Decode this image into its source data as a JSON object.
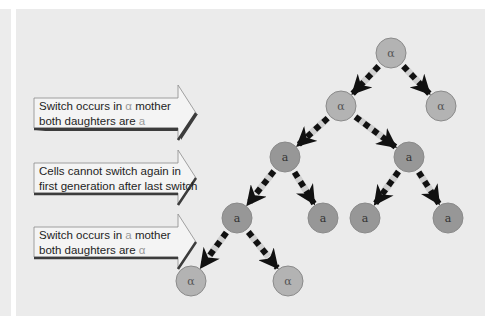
{
  "figure": {
    "title": "",
    "colors": {
      "background": "#ebebeb",
      "alpha_node_fill": "#b3b3b3",
      "a_node_fill": "#979797",
      "node_stroke": "#8a8a8a",
      "arrow": "#111111",
      "dash_light": "#cfcfcf",
      "callout_fill": "#f4f4f4",
      "callout_shadow": "#3c3c3c",
      "highlight_letter": "#9a9a9a"
    }
  },
  "callouts": [
    {
      "line1_pre": "Switch occurs in ",
      "line1_symbol": "α",
      "line1_post": " mother",
      "line2_pre": "both daughters are ",
      "line2_symbol": "a"
    },
    {
      "line1": "Cells cannot switch again in",
      "line2": "first generation after last switch"
    },
    {
      "line1_pre": "Switch occurs in ",
      "line1_symbol": "a",
      "line1_post": " mother",
      "line2_pre": "both daughters are ",
      "line2_symbol": "α"
    }
  ],
  "tree": {
    "nodes": [
      {
        "id": "root",
        "label": "α",
        "type": "alpha",
        "x": 391,
        "y": 53
      },
      {
        "id": "g1-left",
        "label": "α",
        "type": "alpha",
        "x": 341,
        "y": 106
      },
      {
        "id": "g1-right",
        "label": "α",
        "type": "alpha",
        "x": 441,
        "y": 106
      },
      {
        "id": "g2-left",
        "label": "a",
        "type": "a",
        "x": 285,
        "y": 157
      },
      {
        "id": "g2-right",
        "label": "a",
        "type": "a",
        "x": 409,
        "y": 157
      },
      {
        "id": "g3-1",
        "label": "a",
        "type": "a",
        "x": 237,
        "y": 218
      },
      {
        "id": "g3-2",
        "label": "a",
        "type": "a",
        "x": 323,
        "y": 218
      },
      {
        "id": "g3-3",
        "label": "a",
        "type": "a",
        "x": 365,
        "y": 218
      },
      {
        "id": "g3-4",
        "label": "a",
        "type": "a",
        "x": 448,
        "y": 218
      },
      {
        "id": "g4-left",
        "label": "α",
        "type": "alpha",
        "x": 191,
        "y": 281
      },
      {
        "id": "g4-right",
        "label": "α",
        "type": "alpha",
        "x": 288,
        "y": 281
      }
    ],
    "edges": [
      [
        "root",
        "g1-left"
      ],
      [
        "root",
        "g1-right"
      ],
      [
        "g1-left",
        "g2-left"
      ],
      [
        "g1-left",
        "g2-right"
      ],
      [
        "g2-left",
        "g3-1"
      ],
      [
        "g2-left",
        "g3-2"
      ],
      [
        "g2-right",
        "g3-3"
      ],
      [
        "g2-right",
        "g3-4"
      ],
      [
        "g3-1",
        "g4-left"
      ],
      [
        "g3-1",
        "g4-right"
      ]
    ]
  }
}
